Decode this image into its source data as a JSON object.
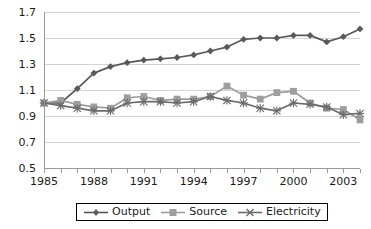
{
  "chart_data": {
    "type": "line",
    "title": "",
    "subtitle": "",
    "xlabel": "",
    "ylabel": "",
    "xlim": [
      1985,
      2004
    ],
    "ylim": [
      0.5,
      1.7
    ],
    "ytick_labels": [
      "1.7",
      "1.5",
      "1.3",
      "1.1",
      "0.9",
      "0.7",
      "0.5"
    ],
    "ytick_values": [
      1.7,
      1.5,
      1.3,
      1.1,
      0.9,
      0.7,
      0.5
    ],
    "xtick_labels": [
      "1985",
      "1988",
      "1991",
      "1994",
      "1997",
      "2000",
      "2003"
    ],
    "xtick_values": [
      1985,
      1988,
      1991,
      1994,
      1997,
      2000,
      2003
    ],
    "grid": true,
    "legend_position": "bottom",
    "x": [
      1985,
      1986,
      1987,
      1988,
      1989,
      1990,
      1991,
      1992,
      1993,
      1994,
      1995,
      1996,
      1997,
      1998,
      1999,
      2000,
      2001,
      2002,
      2003,
      2004
    ],
    "series": [
      {
        "name": "Output",
        "marker": "diamond",
        "color": "#595959",
        "values": [
          1.0,
          1.0,
          1.11,
          1.23,
          1.28,
          1.31,
          1.33,
          1.34,
          1.35,
          1.37,
          1.4,
          1.43,
          1.49,
          1.5,
          1.5,
          1.52,
          1.52,
          1.47,
          1.51,
          1.57
        ]
      },
      {
        "name": "Source",
        "marker": "square",
        "color": "#9e9e9e",
        "values": [
          1.0,
          1.02,
          0.99,
          0.97,
          0.96,
          1.04,
          1.05,
          1.02,
          1.03,
          1.03,
          1.05,
          1.13,
          1.06,
          1.03,
          1.08,
          1.09,
          1.0,
          0.96,
          0.95,
          0.87
        ]
      },
      {
        "name": "Electricity",
        "marker": "cross",
        "color": "#6b6b6b",
        "values": [
          1.0,
          0.98,
          0.96,
          0.94,
          0.94,
          1.0,
          1.01,
          1.01,
          1.0,
          1.01,
          1.05,
          1.02,
          1.0,
          0.96,
          0.94,
          1.0,
          0.99,
          0.97,
          0.91,
          0.92
        ]
      }
    ]
  },
  "legend": {
    "items": [
      {
        "label": "Output"
      },
      {
        "label": "Source"
      },
      {
        "label": "Electricity"
      }
    ]
  }
}
